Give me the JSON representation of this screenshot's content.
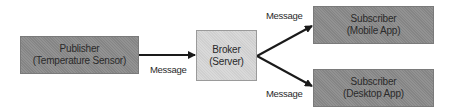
{
  "diagram": {
    "type": "publish-subscribe flow",
    "colors": {
      "background": "#ffffff",
      "dark_node_fill": "#8c8c8c",
      "light_node_fill": "#d6d6d6",
      "text": "#2a2a2a",
      "edge": "#1a1a1a"
    },
    "nodes": {
      "publisher": {
        "title": "Publisher",
        "subtitle": "(Temperature Sensor)"
      },
      "broker": {
        "title": "Broker",
        "subtitle": "(Server)"
      },
      "subscriber_mobile": {
        "title": "Subscriber",
        "subtitle": "(Mobile App)"
      },
      "subscriber_desktop": {
        "title": "Subscriber",
        "subtitle": "(Desktop App)"
      }
    },
    "edges": [
      {
        "from": "publisher",
        "to": "broker",
        "label": "Message"
      },
      {
        "from": "broker",
        "to": "subscriber_mobile",
        "label": "Message"
      },
      {
        "from": "broker",
        "to": "subscriber_desktop",
        "label": "Message"
      }
    ]
  }
}
